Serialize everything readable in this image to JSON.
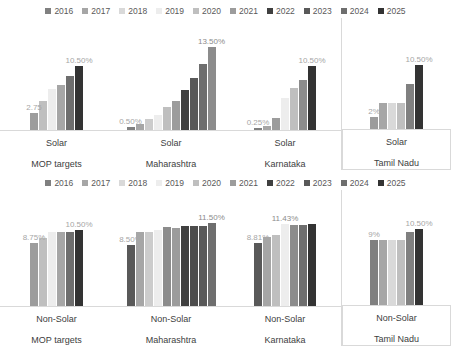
{
  "colors": {
    "s2016": "#808080",
    "s2017": "#a6a6a6",
    "s2018": "#d9d9d9",
    "s2019": "#ededed",
    "s2020": "#bfbfbf",
    "s2021": "#9c9c9c",
    "s2022": "#404040",
    "s2023": "#595959",
    "s2024": "#6e6e6e",
    "s2025": "#333333",
    "axis": "#d9d9d9",
    "annotation": "#a6a6a6",
    "text": "#404040"
  },
  "legend": {
    "items": [
      {
        "label": "2016",
        "color": "#808080"
      },
      {
        "label": "2017",
        "color": "#a6a6a6"
      },
      {
        "label": "2018",
        "color": "#d9d9d9"
      },
      {
        "label": "2019",
        "color": "#ededed"
      },
      {
        "label": "2020",
        "color": "#bfbfbf"
      },
      {
        "label": "2021",
        "color": "#9c9c9c"
      },
      {
        "label": "2022",
        "color": "#404040"
      },
      {
        "label": "2023",
        "color": "#595959"
      },
      {
        "label": "2024",
        "color": "#6e6e6e"
      },
      {
        "label": "2025",
        "color": "#333333"
      }
    ]
  },
  "chart_data": [
    {
      "type": "bar",
      "title": "Solar RPO targets",
      "xlabel": "",
      "ylabel": "",
      "ylim": [
        0,
        14
      ],
      "grid": false,
      "legend_position": "top",
      "categories": [
        "2016",
        "2017",
        "2018",
        "2019",
        "2020",
        "2021",
        "2022",
        "2023",
        "2024",
        "2025"
      ],
      "panels": [
        {
          "group": "MOP targets",
          "category": "Solar",
          "bars": [
            {
              "year": "2016",
              "value": 2.75,
              "color": "#9c9c9c"
            },
            {
              "year": "2017",
              "value": 4.75,
              "color": "#bfbfbf"
            },
            {
              "year": "2018",
              "value": 6.75,
              "color": "#ededed"
            },
            {
              "year": "2019",
              "value": 7.25,
              "color": "#a6a6a6"
            },
            {
              "year": "2020",
              "value": 8.75,
              "color": "#6e6e6e"
            },
            {
              "year": "2021",
              "value": 10.5,
              "color": "#333333"
            }
          ],
          "annotations": [
            {
              "text": "2.75",
              "value": 2.75,
              "bar_index": 0
            },
            {
              "text": "10.50%",
              "value": 10.5,
              "bar_index": 5
            }
          ]
        },
        {
          "group": "Maharashtra",
          "category": "Solar",
          "bars": [
            {
              "year": "2016",
              "value": 0.5,
              "color": "#808080"
            },
            {
              "year": "2017",
              "value": 1.0,
              "color": "#a6a6a6"
            },
            {
              "year": "2018",
              "value": 1.75,
              "color": "#cccccc"
            },
            {
              "year": "2019",
              "value": 2.5,
              "color": "#ededed"
            },
            {
              "year": "2020",
              "value": 3.75,
              "color": "#bfbfbf"
            },
            {
              "year": "2021",
              "value": 4.75,
              "color": "#9c9c9c"
            },
            {
              "year": "2022",
              "value": 6.5,
              "color": "#404040"
            },
            {
              "year": "2023",
              "value": 8.5,
              "color": "#595959"
            },
            {
              "year": "2024",
              "value": 10.75,
              "color": "#6e6e6e"
            },
            {
              "year": "2025",
              "value": 13.5,
              "color": "#8c8c8c"
            }
          ],
          "annotations": [
            {
              "text": "0.50%",
              "value": 0.5,
              "bar_index": 0
            },
            {
              "text": "13.50%",
              "value": 13.5,
              "bar_index": 9
            }
          ]
        },
        {
          "group": "Karnataka",
          "category": "Solar",
          "bars": [
            {
              "year": "2016",
              "value": 0.25,
              "color": "#808080"
            },
            {
              "year": "2017",
              "value": 0.6,
              "color": "#a6a6a6"
            },
            {
              "year": "2018",
              "value": 1.9,
              "color": "#9c9c9c"
            },
            {
              "year": "2019",
              "value": 5.2,
              "color": "#ededed"
            },
            {
              "year": "2020",
              "value": 6.9,
              "color": "#bfbfbf"
            },
            {
              "year": "2021",
              "value": 8.1,
              "color": "#8c8c8c"
            },
            {
              "year": "2022",
              "value": 10.5,
              "color": "#333333"
            }
          ],
          "annotations": [
            {
              "text": "0.25%",
              "value": 0.25,
              "bar_index": 0
            },
            {
              "text": "10.50%",
              "value": 10.5,
              "bar_index": 6
            }
          ]
        },
        {
          "group": "Tamil Nadu",
          "category": "Solar",
          "bars": [
            {
              "year": "2016",
              "value": 2.0,
              "color": "#9c9c9c"
            },
            {
              "year": "2017",
              "value": 4.2,
              "color": "#a6a6a6"
            },
            {
              "year": "2018",
              "value": 4.2,
              "color": "#d9d9d9"
            },
            {
              "year": "2019",
              "value": 4.2,
              "color": "#bfbfbf"
            },
            {
              "year": "2020",
              "value": 7.4,
              "color": "#808080"
            },
            {
              "year": "2021",
              "value": 10.5,
              "color": "#333333"
            }
          ],
          "annotations": [
            {
              "text": "2%",
              "value": 2.0,
              "bar_index": 0
            },
            {
              "text": "10.50%",
              "value": 10.5,
              "bar_index": 5
            }
          ]
        }
      ]
    },
    {
      "type": "bar",
      "title": "Non-Solar RPO targets",
      "xlabel": "",
      "ylabel": "",
      "ylim": [
        0,
        12.5
      ],
      "grid": false,
      "legend_position": "top",
      "categories": [
        "2016",
        "2017",
        "2018",
        "2019",
        "2020",
        "2021",
        "2022",
        "2023",
        "2024",
        "2025"
      ],
      "panels": [
        {
          "group": "MOP targets",
          "category": "Non-Solar",
          "bars": [
            {
              "year": "2016",
              "value": 8.75,
              "color": "#9c9c9c"
            },
            {
              "year": "2017",
              "value": 9.5,
              "color": "#bfbfbf"
            },
            {
              "year": "2018",
              "value": 10.25,
              "color": "#ededed"
            },
            {
              "year": "2019",
              "value": 10.25,
              "color": "#a6a6a6"
            },
            {
              "year": "2020",
              "value": 10.25,
              "color": "#6e6e6e"
            },
            {
              "year": "2021",
              "value": 10.5,
              "color": "#333333"
            }
          ],
          "annotations": [
            {
              "text": "8.75%",
              "value": 8.75,
              "bar_index": 0
            },
            {
              "text": "10.50%",
              "value": 10.5,
              "bar_index": 5
            }
          ]
        },
        {
          "group": "Maharashtra",
          "category": "Non-Solar",
          "bars": [
            {
              "year": "2016",
              "value": 8.5,
              "color": "#595959"
            },
            {
              "year": "2017",
              "value": 10.25,
              "color": "#a6a6a6"
            },
            {
              "year": "2018",
              "value": 10.25,
              "color": "#cccccc"
            },
            {
              "year": "2019",
              "value": 10.6,
              "color": "#ededed"
            },
            {
              "year": "2020",
              "value": 11.0,
              "color": "#8c8c8c"
            },
            {
              "year": "2021",
              "value": 10.8,
              "color": "#9c9c9c"
            },
            {
              "year": "2022",
              "value": 11.1,
              "color": "#404040"
            },
            {
              "year": "2023",
              "value": 11.1,
              "color": "#4d4d4d"
            },
            {
              "year": "2024",
              "value": 11.1,
              "color": "#595959"
            },
            {
              "year": "2025",
              "value": 11.5,
              "color": "#6e6e6e"
            }
          ],
          "annotations": [
            {
              "text": "8.50%",
              "value": 8.5,
              "bar_index": 0
            },
            {
              "text": "11.50%",
              "value": 11.5,
              "bar_index": 9
            }
          ]
        },
        {
          "group": "Karnataka",
          "category": "Non-Solar",
          "bars": [
            {
              "year": "2016",
              "value": 8.81,
              "color": "#595959"
            },
            {
              "year": "2017",
              "value": 9.6,
              "color": "#a6a6a6"
            },
            {
              "year": "2018",
              "value": 9.9,
              "color": "#bfbfbf"
            },
            {
              "year": "2019",
              "value": 11.43,
              "color": "#ededed"
            },
            {
              "year": "2020",
              "value": 11.2,
              "color": "#8c8c8c"
            },
            {
              "year": "2021",
              "value": 11.2,
              "color": "#6e6e6e"
            },
            {
              "year": "2022",
              "value": 11.43,
              "color": "#333333"
            }
          ],
          "annotations": [
            {
              "text": "8.81%",
              "value": 8.81,
              "bar_index": 0
            },
            {
              "text": "11.43%",
              "value": 11.43,
              "bar_index": 3
            }
          ]
        },
        {
          "group": "Tamil Nadu",
          "category": "Non-Solar",
          "bars": [
            {
              "year": "2016",
              "value": 9.0,
              "color": "#808080"
            },
            {
              "year": "2017",
              "value": 9.0,
              "color": "#a6a6a6"
            },
            {
              "year": "2018",
              "value": 9.0,
              "color": "#d9d9d9"
            },
            {
              "year": "2019",
              "value": 9.0,
              "color": "#bfbfbf"
            },
            {
              "year": "2020",
              "value": 10.1,
              "color": "#808080"
            },
            {
              "year": "2021",
              "value": 10.5,
              "color": "#333333"
            }
          ],
          "annotations": [
            {
              "text": "9%",
              "value": 9.0,
              "bar_index": 0
            },
            {
              "text": "10.50%",
              "value": 10.5,
              "bar_index": 5
            }
          ]
        }
      ]
    }
  ]
}
